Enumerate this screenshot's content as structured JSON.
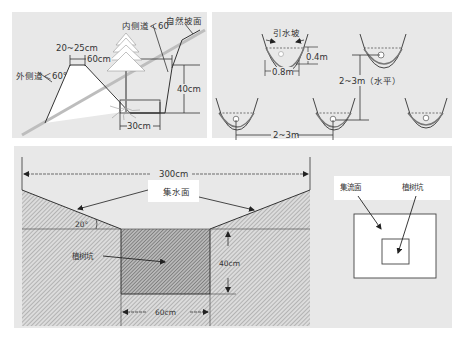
{
  "colors": {
    "panel_bg": "#e8e8e8",
    "line": "#2a2a2a",
    "hatch": "#9a9a9a",
    "white": "#ffffff"
  },
  "panel_slope_pit": {
    "labels": {
      "inner_slope": "内侧道＜60°",
      "natural_slope": "自然坡面",
      "top_width": "20~25cm",
      "rim_width": "60cm",
      "outer_slope": "外侧道＜60°",
      "depth": "40cm",
      "bottom_width": "30cm"
    }
  },
  "panel_fish_scale_pits": {
    "labels": {
      "diversion_slope": "引水坡",
      "pit_depth": "0.4m",
      "pit_width": "0.8m",
      "vertical_spacing": "2~3m（水平）",
      "horizontal_spacing": "2~3m"
    }
  },
  "panel_catchment_section": {
    "labels": {
      "total_width": "300cm",
      "catchment_surface": "集水面",
      "slope_angle": "20°",
      "planting_pit": "植树坑",
      "pit_depth": "40cm",
      "pit_width": "60cm"
    }
  },
  "panel_catchment_plan": {
    "labels": {
      "catchment_surface": "集流面",
      "planting_pit": "植树坑"
    }
  }
}
